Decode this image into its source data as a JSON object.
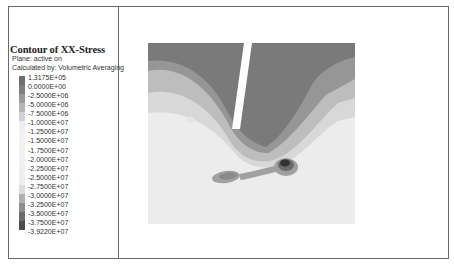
{
  "legend": {
    "title": "Contour of XX-Stress",
    "plane_text": "Plane: active on",
    "calc_text": "Calculated by: Volumetric Averaging",
    "ticks": [
      "1.3175E+05",
      "0.0000E+00",
      "-2.5000E+06",
      "-5.0000E+06",
      "-7.5000E+06",
      "-1.0000E+07",
      "-1.2500E+07",
      "-1.5000E+07",
      "-1.7500E+07",
      "-2.0000E+07",
      "-2.2500E+07",
      "-2.5000E+07",
      "-2.7500E+07",
      "-3.0000E+07",
      "-3.2500E+07",
      "-3.5000E+07",
      "-3.7500E+07",
      "-3.9220E+07"
    ],
    "colors": [
      "#6e6e6e",
      "#7e7e7e",
      "#9a9a9a",
      "#b5b5b5",
      "#d2d2d2",
      "#eeeeee",
      "#f2f2f2",
      "#f2f2f2",
      "#f1f1f1",
      "#f0f0f0",
      "#efefef",
      "#eeeeee",
      "#dddddd",
      "#b0b0b0",
      "#8e8e8e",
      "#6c6c6c",
      "#4e4e4e"
    ]
  },
  "plot": {
    "colors": {
      "background": "#ececec",
      "dark_band": "#7a7a7a",
      "mid_band": "#969696",
      "light_band": "#bdbdbd",
      "lighter_band": "#d8d8d8",
      "crack": "#ffffff",
      "blob_outer": "#a0a0a0",
      "blob_inner": "#6a6a6a",
      "blob_core": "#333333"
    }
  }
}
